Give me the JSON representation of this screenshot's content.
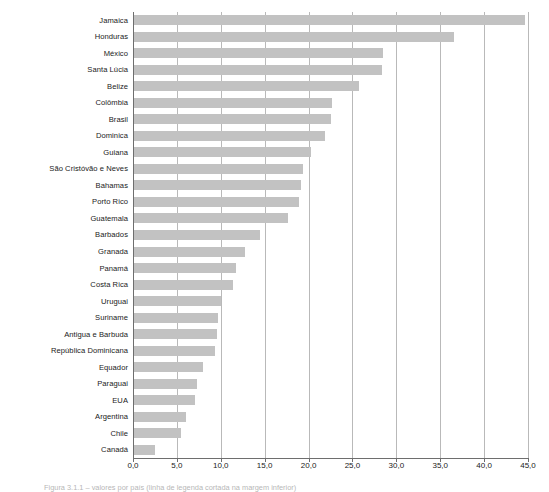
{
  "chart_data": {
    "type": "bar",
    "orientation": "horizontal",
    "title": "",
    "subtitle": "",
    "xlabel": "",
    "ylabel": "",
    "xlim": [
      0.0,
      45.0
    ],
    "xticks": [
      0.0,
      5.0,
      10.0,
      15.0,
      20.0,
      25.0,
      30.0,
      35.0,
      40.0,
      45.0
    ],
    "xtick_labels": [
      "0,0",
      "5,0",
      "10,0",
      "15,0",
      "20,0",
      "25,0",
      "30,0",
      "35,0",
      "40,0",
      "45,0"
    ],
    "decimal_separator": ",",
    "grid": "vertical",
    "legend": "none",
    "bar_color": "#c2c2c2",
    "axis_color": "#6e6e6e",
    "gridline_color": "#b9b9b9",
    "categories": [
      "Jamaica",
      "Honduras",
      "México",
      "Santa Lúcia",
      "Belize",
      "Colômbia",
      "Brasil",
      "Dominica",
      "Guiana",
      "São Cristóvão e Neves",
      "Bahamas",
      "Porto Rico",
      "Guatemala",
      "Barbados",
      "Granada",
      "Panamá",
      "Costa Rica",
      "Uruguai",
      "Suriname",
      "Antigua e Barbuda",
      "República Dominicana",
      "Equador",
      "Paraguai",
      "EUA",
      "Argentina",
      "Chile",
      "Canadá"
    ],
    "values": [
      44.6,
      36.4,
      28.4,
      28.3,
      25.6,
      22.6,
      22.4,
      21.8,
      20.2,
      19.2,
      19.0,
      18.8,
      17.6,
      14.3,
      12.6,
      11.6,
      11.3,
      9.9,
      9.6,
      9.5,
      9.2,
      7.9,
      7.2,
      6.9,
      5.9,
      5.4,
      2.4
    ]
  },
  "caption": {
    "text": "Figura 3.1.1 – valores por país (linha de legenda cortada na margem inferior)"
  }
}
